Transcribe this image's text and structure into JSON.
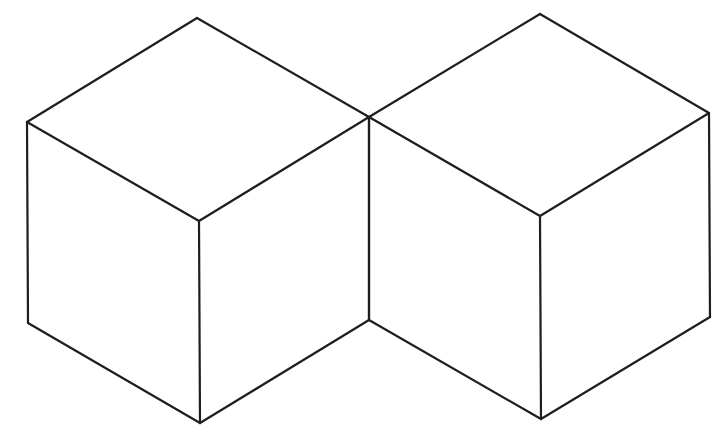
{
  "diagram": {
    "title": "",
    "stroke_color": "#1e1e1e",
    "background": "#ffffff",
    "cubes": [
      {
        "name": "left-cube",
        "vertices": {
          "top": [
            197,
            18
          ],
          "left_top": [
            27,
            122
          ],
          "front_top": [
            199,
            221
          ],
          "right_top": [
            369,
            117
          ],
          "left_bottom": [
            28,
            323
          ],
          "front_bottom": [
            200,
            423
          ],
          "right_bottom": [
            369,
            320
          ]
        }
      },
      {
        "name": "right-cube",
        "vertices": {
          "top": [
            540,
            14
          ],
          "left_top": [
            369,
            117
          ],
          "front_top": [
            540,
            216
          ],
          "right_top": [
            709,
            113
          ],
          "left_bottom": [
            369,
            320
          ],
          "front_bottom": [
            541,
            419
          ],
          "right_bottom": [
            710,
            317
          ]
        }
      }
    ]
  }
}
